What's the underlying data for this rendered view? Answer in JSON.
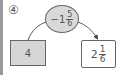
{
  "problem": {
    "number_label": "④",
    "operation": {
      "sign": "−",
      "whole": "1",
      "numerator": "5",
      "denominator": "6"
    },
    "start_box": {
      "value": "4"
    },
    "result_box": {
      "whole": "2",
      "numerator": "1",
      "denominator": "6"
    }
  },
  "colors": {
    "ellipse_fill": "#d9d9d9",
    "start_box_fill": "#d6d6d6",
    "result_box_fill": "#ffffff",
    "stroke": "#666666",
    "text": "#555555",
    "left_bar": "#9a9a9a"
  }
}
